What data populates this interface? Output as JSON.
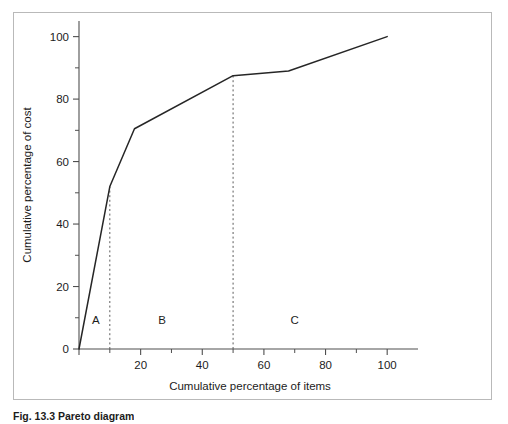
{
  "figure": {
    "caption": "Fig. 13.3 Pareto diagram"
  },
  "chart_data": {
    "type": "line",
    "title": "",
    "xlabel": "Cumulative percentage of items",
    "ylabel": "Cumulative percentage of cost",
    "xlim": [
      0,
      110
    ],
    "ylim": [
      0,
      105
    ],
    "grid": false,
    "legend": "none",
    "x_ticks_major": [
      0,
      20,
      40,
      60,
      80,
      100
    ],
    "x_tick_labels": [
      "",
      "20",
      "40",
      "60",
      "80",
      "100"
    ],
    "x_ticks_minor": [
      10,
      30,
      50,
      70,
      90
    ],
    "y_ticks_major": [
      0,
      20,
      40,
      60,
      80,
      100
    ],
    "y_tick_labels": [
      "0",
      "20",
      "40",
      "60",
      "80",
      "100"
    ],
    "y_ticks_minor": [
      10,
      30,
      50,
      70,
      90
    ],
    "series": [
      {
        "name": "Cumulative cost curve",
        "x": [
          0,
          10,
          18,
          50,
          68,
          100
        ],
        "values": [
          0,
          52,
          70.5,
          87.5,
          89,
          100
        ]
      }
    ],
    "dividers": [
      {
        "name": "A-B boundary",
        "x": 10
      },
      {
        "name": "B-C boundary",
        "x": 50
      }
    ],
    "annotations": [
      {
        "label": "A",
        "x": 5.5,
        "y": 8
      },
      {
        "label": "B",
        "x": 27,
        "y": 8
      },
      {
        "label": "C",
        "x": 70,
        "y": 8
      }
    ]
  }
}
